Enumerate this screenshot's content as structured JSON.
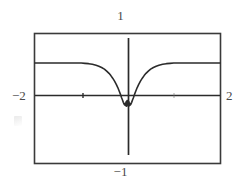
{
  "figure": {
    "kind": "graphing-calculator-plot",
    "background_color": "#ffffff",
    "frame_color": "#3a3a3a",
    "axis_color": "#2b2b2b",
    "curve_color": "#2b2b2b",
    "label_color": "#4a4a4a"
  },
  "labels": {
    "top": "1",
    "bottom": "−1",
    "left": "−2",
    "right": "2"
  },
  "chart_data": {
    "type": "line",
    "title": "",
    "xlabel": "",
    "ylabel": "",
    "xlim": [
      -2,
      2
    ],
    "ylim": [
      -1,
      1
    ],
    "grid": false,
    "legend": null,
    "xticks": [
      -2,
      -1,
      0,
      1,
      2
    ],
    "xticklabels": [
      "−2",
      "",
      "",
      "",
      "2"
    ],
    "yticks": [
      -1,
      0,
      1
    ],
    "yticklabels": [
      "−1",
      "",
      "1"
    ],
    "axis_style": "centered-cross-with-box-frame",
    "series": [
      {
        "name": "f(x)",
        "x": [
          -2.0,
          -1.9,
          -1.8,
          -1.7,
          -1.6,
          -1.5,
          -1.4,
          -1.3,
          -1.2,
          -1.1,
          -1.0,
          -0.92,
          -0.84,
          -0.76,
          -0.68,
          -0.62,
          -0.56,
          -0.5,
          -0.45,
          -0.4,
          -0.36,
          -0.32,
          -0.28,
          -0.24,
          -0.21,
          -0.18,
          -0.15,
          -0.13,
          -0.11,
          -0.09,
          -0.075,
          -0.06,
          -0.05,
          -0.04,
          -0.03,
          -0.02,
          -0.01,
          0.0,
          0.01,
          0.02,
          0.03,
          0.04,
          0.05,
          0.06,
          0.075,
          0.09,
          0.11,
          0.13,
          0.15,
          0.18,
          0.21,
          0.24,
          0.28,
          0.32,
          0.36,
          0.4,
          0.45,
          0.5,
          0.56,
          0.62,
          0.68,
          0.76,
          0.84,
          0.92,
          1.0,
          1.1,
          1.2,
          1.3,
          1.4,
          1.5,
          1.6,
          1.7,
          1.8,
          1.9,
          2.0
        ],
        "y": [
          0.55,
          0.55,
          0.55,
          0.55,
          0.55,
          0.55,
          0.55,
          0.55,
          0.55,
          0.55,
          0.55,
          0.545,
          0.54,
          0.53,
          0.515,
          0.5,
          0.48,
          0.455,
          0.425,
          0.39,
          0.355,
          0.315,
          0.27,
          0.215,
          0.17,
          0.115,
          0.06,
          0.015,
          -0.02,
          -0.06,
          -0.085,
          -0.1,
          -0.075,
          -0.11,
          -0.05,
          -0.12,
          -0.03,
          -0.1,
          -0.03,
          -0.12,
          -0.05,
          -0.11,
          -0.075,
          -0.1,
          -0.085,
          -0.06,
          -0.02,
          0.015,
          0.06,
          0.115,
          0.17,
          0.215,
          0.27,
          0.315,
          0.355,
          0.39,
          0.425,
          0.455,
          0.48,
          0.5,
          0.515,
          0.53,
          0.54,
          0.545,
          0.55,
          0.55,
          0.55,
          0.55,
          0.55,
          0.55,
          0.55,
          0.55,
          0.55,
          0.55,
          0.55
        ]
      }
    ],
    "tick_marks_on_x_axis": [
      -1.0,
      1.0
    ]
  }
}
